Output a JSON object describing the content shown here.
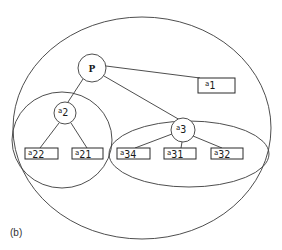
{
  "caption": "(b)",
  "root": {
    "label": "P"
  },
  "nodes": {
    "a1": {
      "base": "a",
      "index": "1"
    },
    "a2": {
      "base": "a",
      "index": "2"
    },
    "a3": {
      "base": "a",
      "index": "3"
    },
    "a21": {
      "base": "a",
      "index": "21"
    },
    "a22": {
      "base": "a",
      "index": "22"
    },
    "a31": {
      "base": "a",
      "index": "31"
    },
    "a32": {
      "base": "a",
      "index": "32"
    },
    "a34": {
      "base": "a",
      "index": "34"
    }
  },
  "edges": [
    [
      "P",
      "a1"
    ],
    [
      "P",
      "a2"
    ],
    [
      "P",
      "a3"
    ],
    [
      "a2",
      "a22"
    ],
    [
      "a2",
      "a21"
    ],
    [
      "a3",
      "a34"
    ],
    [
      "a3",
      "a31"
    ],
    [
      "a3",
      "a32"
    ]
  ],
  "groupings": [
    {
      "name": "outer-set",
      "members": [
        "P",
        "a1",
        "a2",
        "a3",
        "a21",
        "a22",
        "a31",
        "a32",
        "a34"
      ]
    },
    {
      "name": "a2-set",
      "members": [
        "a2",
        "a22",
        "a21"
      ]
    },
    {
      "name": "a3-set",
      "members": [
        "a3",
        "a34",
        "a31",
        "a32"
      ]
    }
  ]
}
